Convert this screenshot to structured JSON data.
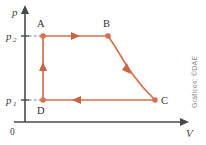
{
  "figure": {
    "kind": "pv-cycle-diagram",
    "background_color": "#ffffff",
    "curve_color": "#d4714f",
    "axis_color": "#4a4a4a",
    "guide_color": "#5b7fa6",
    "credit": "Gráficos: ©DAE"
  },
  "axes": {
    "y_label": "p",
    "x_label": "V",
    "origin_label": "0",
    "y_ticks": [
      {
        "id": "p2",
        "base": "p",
        "sub": "2",
        "y_px": 36
      },
      {
        "id": "p1",
        "base": "p",
        "sub": "1",
        "y_px": 100
      }
    ]
  },
  "points": [
    {
      "id": "A",
      "label": "A",
      "x_px": 43,
      "y_px": 36,
      "label_x": 37,
      "label_y": 27
    },
    {
      "id": "B",
      "label": "B",
      "x_px": 108,
      "y_px": 36,
      "label_x": 103,
      "label_y": 27
    },
    {
      "id": "C",
      "label": "C",
      "x_px": 155,
      "y_px": 100,
      "label_x": 160,
      "label_y": 104
    },
    {
      "id": "D",
      "label": "D",
      "x_px": 43,
      "y_px": 100,
      "label_x": 37,
      "label_y": 113
    }
  ],
  "processes": [
    {
      "id": "AB",
      "from": "A",
      "to": "B",
      "type": "isobaric-expansion",
      "shape": "straight",
      "direction": "right"
    },
    {
      "id": "BC",
      "from": "B",
      "to": "C",
      "type": "isothermal-expansion",
      "shape": "hyperbolic",
      "direction": "down-right"
    },
    {
      "id": "CD",
      "from": "C",
      "to": "D",
      "type": "isobaric-compression",
      "shape": "straight",
      "direction": "left"
    },
    {
      "id": "DA",
      "from": "D",
      "to": "A",
      "type": "isochoric-pressurization",
      "shape": "straight",
      "direction": "up"
    }
  ]
}
